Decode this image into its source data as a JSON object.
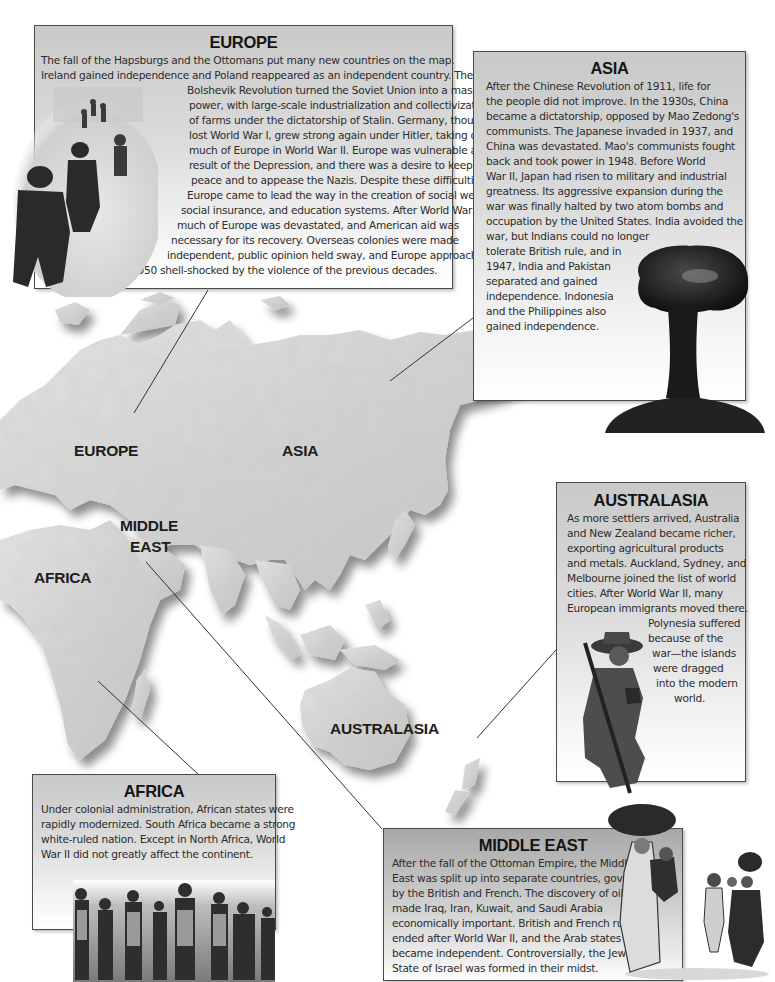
{
  "page": {
    "type": "illustrated reference spread"
  },
  "map": {
    "labels": [
      {
        "id": "europe",
        "text": "EUROPE"
      },
      {
        "id": "asia",
        "text": "ASIA"
      },
      {
        "id": "middle_east_1",
        "text": "MIDDLE"
      },
      {
        "id": "middle_east_2",
        "text": "EAST"
      },
      {
        "id": "africa",
        "text": "AFRICA"
      },
      {
        "id": "australasia",
        "text": "AUSTRALASIA"
      }
    ]
  },
  "boxes": {
    "europe": {
      "title": "EUROPE",
      "lines": [
        "The fall of the Hapsburgs and the Ottomans put many new countries on the map.",
        "Ireland gained independence and Poland reappeared as an independent country. The",
        "Bolshevik Revolution turned the Soviet Union into a massive",
        "power, with large-scale industrialization and collectivization",
        "of farms under the dictatorship of Stalin. Germany, though it",
        "lost World War I, grew strong again under Hitler, taking over",
        "much of Europe in World War II. Europe was vulnerable as a",
        "result of the Depression, and there was a desire to keep",
        "peace and to appease the Nazis. Despite these difficulties,",
        "Europe came to lead the way in the creation of social welfare,",
        "social insurance, and education systems. After World War II,",
        "much of Europe was devastated, and American aid was",
        "necessary for its recovery. Overseas colonies were made",
        "independent, public opinion held sway, and Europe approached",
        "1950 shell-shocked by the violence of the previous decades."
      ],
      "image": "soldiers wading ashore"
    },
    "asia": {
      "title": "ASIA",
      "lines": [
        "After the Chinese Revolution of 1911, life for",
        "the people did not improve. In the 1930s, China",
        "became a dictatorship, opposed by Mao Zedong's",
        "communists. The Japanese invaded in 1937, and",
        "China was devastated. Mao's communists fought",
        "back and took power in 1948. Before World",
        "War II, Japan had risen to military and industrial",
        "greatness. Its aggressive expansion during the",
        "war was finally halted by two atom bombs and",
        "occupation by the United States. India avoided the",
        "war, but Indians could no longer",
        "tolerate British rule, and in",
        "1947, India and Pakistan",
        "separated and gained",
        "independence. Indonesia",
        "and the Philippines also",
        "gained independence."
      ],
      "image": "atomic mushroom cloud"
    },
    "australasia": {
      "title": "AUSTRALASIA",
      "lines": [
        "As more settlers arrived, Australia",
        "and New Zealand became richer,",
        "exporting agricultural products",
        "and metals. Auckland, Sydney, and",
        "Melbourne joined the list of world",
        "cities. After World War II, many",
        "European immigrants moved there.",
        "Polynesia suffered",
        "because of the",
        "war—the islands",
        "were dragged",
        "into the modern",
        "world."
      ],
      "image": "kneeling soldier with rifle"
    },
    "africa": {
      "title": "AFRICA",
      "lines": [
        "Under colonial administration, African states were",
        "rapidly modernized. South Africa became a strong",
        "white-ruled nation. Except in North Africa, World",
        "War II did not greatly affect the continent."
      ],
      "image": "colonial soldiers in line"
    },
    "mideast": {
      "title": "MIDDLE EAST",
      "lines": [
        "After the fall of the Ottoman Empire, the Middle",
        "East was split up into separate countries, governed",
        "by the British and French. The discovery of oil",
        "made Iraq, Iran, Kuwait, and Saudi Arabia",
        "economically important. British and French rule",
        "ended after World War II, and the Arab states",
        "became independent. Controversially, the Jewish",
        "State of Israel was formed in their midst."
      ],
      "image": "refugee family carrying bundles"
    }
  },
  "colors": {
    "box_border": "#4a4a4a",
    "box_top": "#c9c9c9",
    "box_bottom": "#ffffff",
    "land": "#d4d4d4",
    "land_shadow": "#9a9a9a",
    "text": "#2c2c2c",
    "leader_line": "#333333"
  }
}
